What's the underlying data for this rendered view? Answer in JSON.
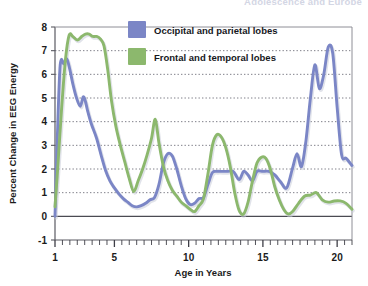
{
  "running_head": "Adolescence and Europe",
  "chart_data": {
    "type": "line",
    "title": "",
    "xlabel": "Age in Years",
    "ylabel": "Percent Change in EEG Energy",
    "xlim": [
      1,
      21
    ],
    "ylim": [
      -1,
      8
    ],
    "xticks": [
      1,
      5,
      10,
      15,
      20
    ],
    "xticklabels": [
      "1",
      "5",
      "10",
      "15",
      "20"
    ],
    "yticks": [
      -1,
      0,
      1,
      2,
      3,
      4,
      5,
      6,
      7,
      8
    ],
    "yticklabels": [
      "-1",
      "0",
      "1",
      "2",
      "3",
      "4",
      "5",
      "6",
      "7",
      "8"
    ],
    "minor_xtick_step": 0.5,
    "grid": "horizontal-dotted",
    "zero_line": true,
    "legend_position": "top-center",
    "series": [
      {
        "name": "Occipital and parietal lobes",
        "color": "#7b86c6",
        "x": [
          1.0,
          1.15,
          1.35,
          1.6,
          1.8,
          2.0,
          2.2,
          2.45,
          2.7,
          2.9,
          3.05,
          3.2,
          3.45,
          3.8,
          4.1,
          4.4,
          4.7,
          5.0,
          5.3,
          5.6,
          5.9,
          6.2,
          6.5,
          6.8,
          7.1,
          7.4,
          7.7,
          8.0,
          8.3,
          8.6,
          8.9,
          9.2,
          9.5,
          9.8,
          10.1,
          10.4,
          10.7,
          11.0,
          11.3,
          11.6,
          11.9,
          12.2,
          12.6,
          13.0,
          13.4,
          13.7,
          14.0,
          14.3,
          14.6,
          15.0,
          15.4,
          15.8,
          16.2,
          16.6,
          17.0,
          17.3,
          17.6,
          17.9,
          18.2,
          18.5,
          18.8,
          19.1,
          19.4,
          19.7,
          20.0,
          20.3,
          20.6,
          21.0
        ],
        "y": [
          0.0,
          3.2,
          6.4,
          6.45,
          6.65,
          6.2,
          5.6,
          5.0,
          4.65,
          5.05,
          4.85,
          4.45,
          3.9,
          3.3,
          2.6,
          1.95,
          1.5,
          1.2,
          0.95,
          0.75,
          0.6,
          0.45,
          0.4,
          0.45,
          0.55,
          0.7,
          0.8,
          1.35,
          2.25,
          2.65,
          2.55,
          2.0,
          1.3,
          0.75,
          0.5,
          0.55,
          0.75,
          0.8,
          1.35,
          1.85,
          1.9,
          1.9,
          1.9,
          1.9,
          1.55,
          1.9,
          1.75,
          1.5,
          1.9,
          1.9,
          1.9,
          1.75,
          1.45,
          1.2,
          2.05,
          2.65,
          2.1,
          3.2,
          5.0,
          6.4,
          5.4,
          6.0,
          7.15,
          6.9,
          4.6,
          2.6,
          2.45,
          2.15
        ]
      },
      {
        "name": "Frontal and temporal lobes",
        "color": "#8cb86d",
        "x": [
          1.0,
          1.2,
          1.45,
          1.7,
          1.95,
          2.2,
          2.5,
          2.8,
          3.05,
          3.3,
          3.55,
          3.8,
          4.05,
          4.3,
          4.55,
          4.8,
          5.1,
          5.4,
          5.7,
          6.0,
          6.3,
          6.6,
          6.9,
          7.2,
          7.5,
          7.75,
          8.0,
          8.3,
          8.6,
          8.9,
          9.2,
          9.5,
          9.8,
          10.1,
          10.4,
          10.7,
          11.0,
          11.3,
          11.6,
          11.9,
          12.2,
          12.5,
          12.8,
          13.1,
          13.4,
          13.7,
          14.0,
          14.3,
          14.6,
          14.9,
          15.2,
          15.5,
          15.8,
          16.1,
          16.4,
          16.7,
          17.0,
          17.4,
          17.8,
          18.2,
          18.6,
          19.0,
          19.4,
          19.8,
          20.2,
          20.6,
          21.0
        ],
        "y": [
          0.4,
          2.2,
          4.6,
          6.6,
          7.65,
          7.6,
          7.45,
          7.6,
          7.7,
          7.7,
          7.6,
          7.6,
          7.5,
          7.2,
          6.2,
          4.9,
          3.8,
          3.0,
          2.3,
          1.6,
          1.05,
          1.5,
          2.0,
          2.6,
          3.3,
          4.1,
          3.1,
          2.1,
          1.5,
          1.1,
          0.85,
          0.6,
          0.45,
          0.3,
          0.2,
          0.45,
          0.75,
          1.8,
          3.0,
          3.45,
          3.35,
          2.9,
          2.1,
          1.0,
          0.25,
          0.1,
          0.6,
          1.5,
          2.25,
          2.5,
          2.45,
          2.0,
          1.25,
          0.7,
          0.3,
          0.1,
          0.2,
          0.55,
          0.85,
          0.9,
          1.0,
          0.7,
          0.6,
          0.65,
          0.65,
          0.55,
          0.3
        ]
      }
    ]
  },
  "legend": {
    "items": [
      {
        "label": "Occipital and parietal lobes",
        "color": "#7b86c6"
      },
      {
        "label": "Frontal and temporal lobes",
        "color": "#8cb86d"
      }
    ]
  }
}
